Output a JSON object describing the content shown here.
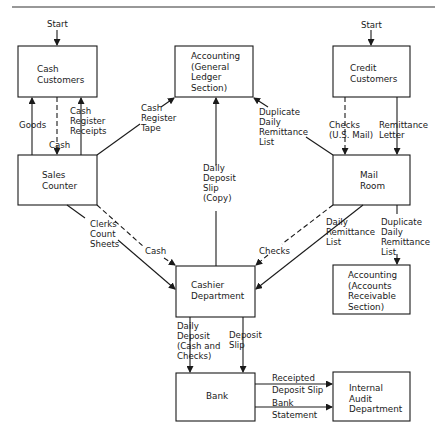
{
  "diagram": {
    "type": "flowchart",
    "nodes": {
      "cash_customers": "Cash\nCustomers",
      "accounting_gl": "Accounting\n(General\nLedger\nSection)",
      "credit_customers": "Credit\nCustomers",
      "sales_counter": "Sales\nCounter",
      "mail_room": "Mail\nRoom",
      "cashier_department": "Cashier\nDepartment",
      "accounting_ar": "Accounting\n(Accounts\nReceivable\nSection)",
      "bank": "Bank",
      "internal_audit": "Internal\nAudit\nDepartment"
    },
    "edge_labels": {
      "start_left": "Start",
      "start_right": "Start",
      "goods": "Goods",
      "cash_sales": "Cash",
      "cash_register_receipts": "Cash\nRegister\nReceipts",
      "cash_register_tape": "Cash\nRegister\nTape",
      "duplicate_daily_remittance_gl": "Duplicate\nDaily\nRemittance\nList",
      "checks_us_mail": "Checks\n(U.S. Mail)",
      "remittance_letter": "Remittance\nLetter",
      "daily_deposit_slip_copy": "Daily\nDeposit\nSlip\n(Copy)",
      "clerks_count_sheets": "Clerks\nCount\nSheets",
      "cash_to_cashier": "Cash",
      "checks_to_cashier": "Checks",
      "daily_remittance_list": "Daily\nRemittance\nList",
      "duplicate_daily_remittance_ar": "Duplicate\nDaily\nRemittance\nList",
      "daily_deposit": "Daily\nDeposit\n(Cash and\nChecks)",
      "deposit_slip": "Deposit\nSlip",
      "receipted_deposit_slip": "Receipted\nDeposit Slip",
      "bank_statement": "Bank\nStatement"
    },
    "edges": [
      {
        "from": "start",
        "to": "cash_customers",
        "style": "solid"
      },
      {
        "from": "start",
        "to": "credit_customers",
        "style": "solid"
      },
      {
        "from": "sales_counter",
        "to": "cash_customers",
        "label": "Goods",
        "style": "solid"
      },
      {
        "from": "cash_customers",
        "to": "sales_counter",
        "label": "Cash",
        "style": "dashed"
      },
      {
        "from": "sales_counter",
        "to": "cash_customers",
        "label": "Cash Register Receipts",
        "style": "solid"
      },
      {
        "from": "sales_counter",
        "to": "accounting_gl",
        "label": "Cash Register Tape",
        "style": "solid"
      },
      {
        "from": "mail_room",
        "to": "accounting_gl",
        "label": "Duplicate Daily Remittance List",
        "style": "solid"
      },
      {
        "from": "credit_customers",
        "to": "mail_room",
        "label": "Checks (U.S. Mail)",
        "style": "dashed"
      },
      {
        "from": "credit_customers",
        "to": "mail_room",
        "label": "Remittance Letter",
        "style": "solid"
      },
      {
        "from": "cashier_department",
        "to": "accounting_gl",
        "label": "Daily Deposit Slip (Copy)",
        "style": "solid"
      },
      {
        "from": "sales_counter",
        "to": "cashier_department",
        "label": "Clerks Count Sheets",
        "style": "solid"
      },
      {
        "from": "sales_counter",
        "to": "cashier_department",
        "label": "Cash",
        "style": "dashed"
      },
      {
        "from": "mail_room",
        "to": "cashier_department",
        "label": "Checks",
        "style": "dashed"
      },
      {
        "from": "mail_room",
        "to": "cashier_department",
        "label": "Daily Remittance List",
        "style": "solid"
      },
      {
        "from": "mail_room",
        "to": "accounting_ar",
        "label": "Duplicate Daily Remittance List",
        "style": "solid"
      },
      {
        "from": "cashier_department",
        "to": "bank",
        "label": "Daily Deposit (Cash and Checks)",
        "style": "solid"
      },
      {
        "from": "cashier_department",
        "to": "bank",
        "label": "Deposit Slip",
        "style": "solid"
      },
      {
        "from": "bank",
        "to": "internal_audit",
        "label": "Receipted Deposit Slip",
        "style": "solid"
      },
      {
        "from": "bank",
        "to": "internal_audit",
        "label": "Bank Statement",
        "style": "solid"
      }
    ]
  }
}
